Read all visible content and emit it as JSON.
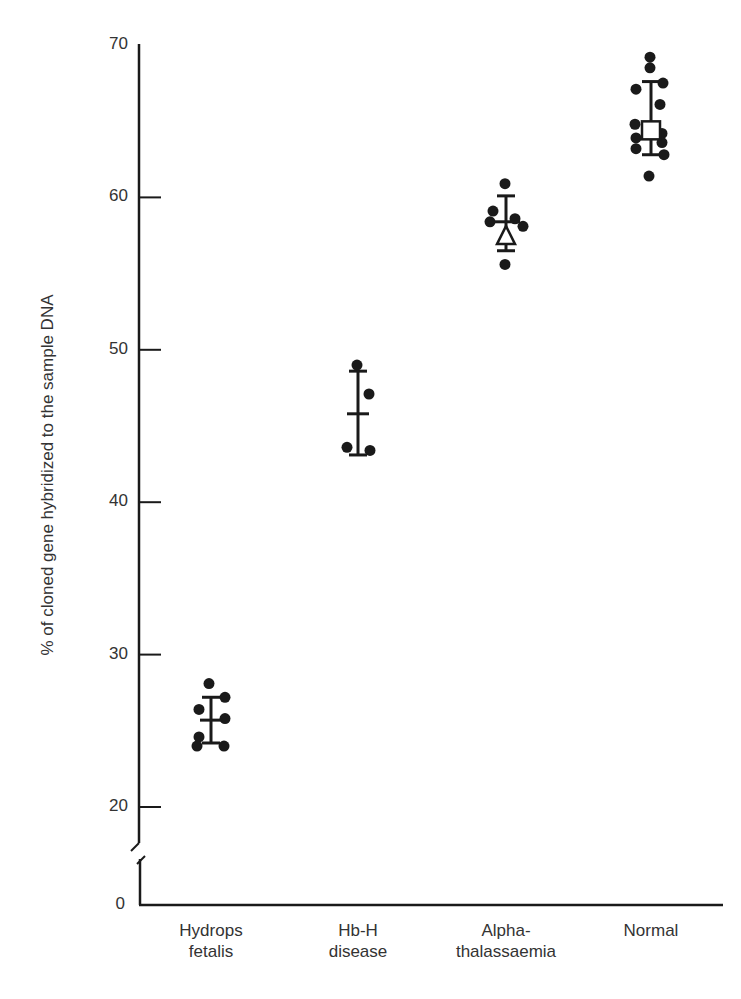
{
  "chart_data": {
    "type": "scatter",
    "title": "",
    "xlabel": "",
    "ylabel": "% of cloned gene hybridized to the sample DNA",
    "ylim": [
      0,
      70
    ],
    "y_axis_break": true,
    "y_ticks": [
      0,
      20,
      30,
      40,
      50,
      60,
      70
    ],
    "grid": false,
    "legend": null,
    "categories": [
      {
        "label_lines": [
          "Hydrops",
          "fetalis"
        ],
        "label": "Hydrops fetalis"
      },
      {
        "label_lines": [
          "Hb-H",
          "disease"
        ],
        "label": "Hb-H disease"
      },
      {
        "label_lines": [
          "Alpha-",
          "thalassaemia"
        ],
        "label": "Alpha-thalassaemia"
      },
      {
        "label_lines": [
          "Normal"
        ],
        "label": "Normal"
      }
    ],
    "series": [
      {
        "name": "Hydrops fetalis",
        "marker": "plus",
        "mean": 25.7,
        "sd_low": 24.2,
        "sd_high": 27.2,
        "points": [
          28.1,
          27.2,
          26.4,
          25.8,
          24.6,
          24.0,
          24.0
        ]
      },
      {
        "name": "Hb-H disease",
        "marker": "plus",
        "mean": 45.8,
        "sd_low": 43.1,
        "sd_high": 48.6,
        "points": [
          49.0,
          47.1,
          43.6,
          43.4
        ]
      },
      {
        "name": "Alpha-thalassaemia",
        "marker": "open-triangle",
        "mean": 57.2,
        "sd_low": 56.5,
        "sd_high": 60.1,
        "points": [
          60.9,
          59.1,
          58.6,
          58.4,
          58.1,
          55.6
        ]
      },
      {
        "name": "Normal",
        "marker": "open-square",
        "mean": 64.4,
        "sd_low": 62.8,
        "sd_high": 67.6,
        "points": [
          69.2,
          68.5,
          67.5,
          67.1,
          66.1,
          64.8,
          64.2,
          63.9,
          63.6,
          63.2,
          62.8,
          61.4
        ]
      }
    ]
  }
}
